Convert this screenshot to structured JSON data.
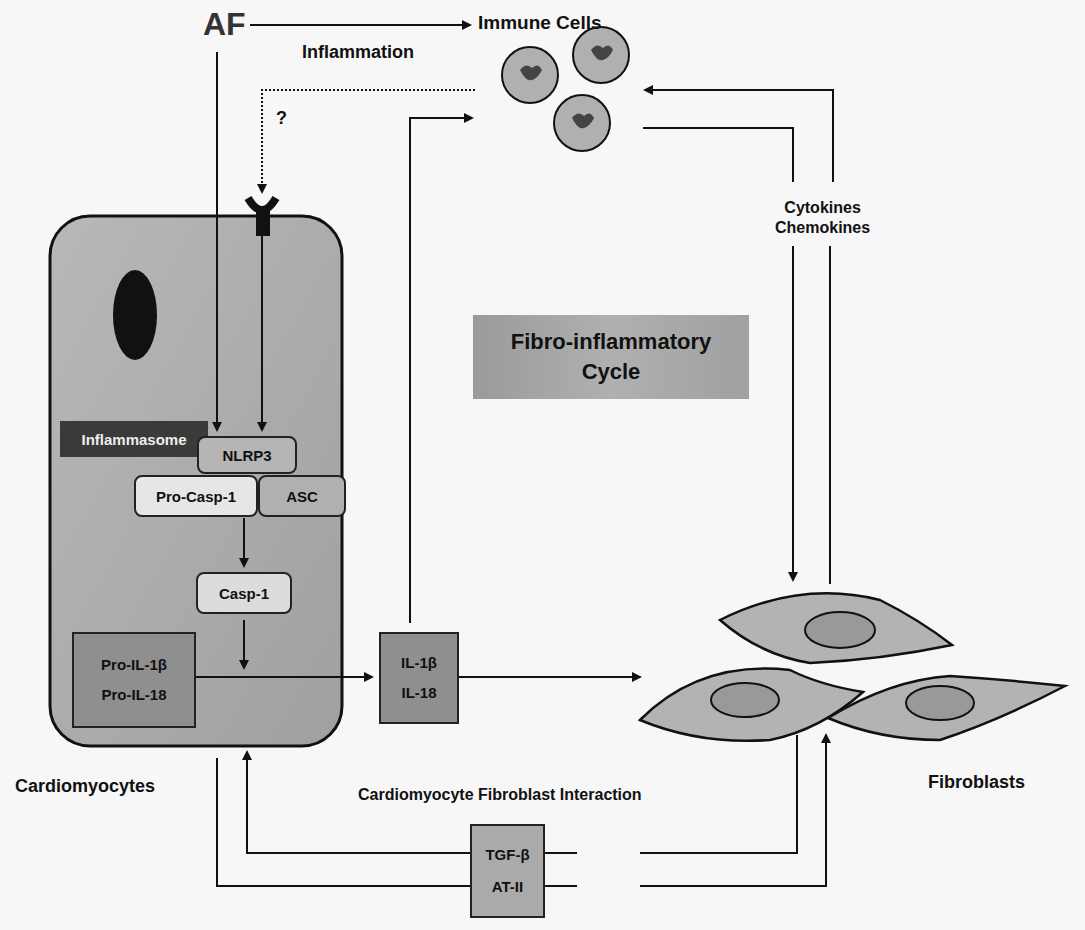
{
  "figure": {
    "title_box": {
      "line1": "Fibro-inflammatory",
      "line2": "Cycle"
    },
    "af_label": "AF",
    "inflammation_label": "Inflammation",
    "question_mark": "?",
    "immune_cells_label": "Immune Cells",
    "cytokines_label": {
      "line1": "Cytokines",
      "line2": "Chemokines"
    },
    "inflammasome_label": "Inflammasome",
    "nlrp3": "NLRP3",
    "pro_casp1": "Pro-Casp-1",
    "asc": "ASC",
    "casp1": "Casp-1",
    "pro_il": {
      "line1": "Pro-IL-1β",
      "line2": "Pro-IL-18"
    },
    "il": {
      "line1": "IL-1β",
      "line2": "IL-18"
    },
    "cardiomyocytes_label": "Cardiomyocytes",
    "interaction_label": "Cardiomyocyte Fibroblast Interaction",
    "tgf": {
      "line1": "TGF-β",
      "line2": "AT-II"
    },
    "fibroblasts_label": "Fibroblasts"
  },
  "colors": {
    "cell_fill": "#a9a9a9",
    "fibroblast_fill": "#b3b3b3",
    "nucleus_fill": "#999999",
    "immune_fill": "#b0b0b0",
    "dark_box": "#3a3a3a",
    "line": "#111111"
  }
}
